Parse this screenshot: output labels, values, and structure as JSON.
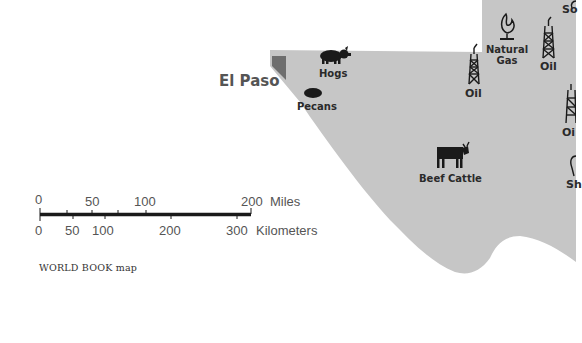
{
  "map": {
    "colors": {
      "land": "#c6c6c6",
      "water_border": "#6e6e6e",
      "icon": "#1a1a1a",
      "label": "#2a2a2a",
      "city": "#555555"
    },
    "city": {
      "name": "El Paso"
    },
    "products": [
      {
        "id": "hogs",
        "label": "Hogs",
        "icon": "pig-icon"
      },
      {
        "id": "pecans",
        "label": "Pecans",
        "icon": "pecan-icon"
      },
      {
        "id": "oil-1",
        "label": "Oil",
        "icon": "oil-derrick-icon"
      },
      {
        "id": "natural-gas",
        "label_line1": "Natural",
        "label_line2": "Gas",
        "icon": "gas-flame-icon"
      },
      {
        "id": "oil-2",
        "label": "Oil",
        "icon": "oil-derrick-icon"
      },
      {
        "id": "oil-3",
        "label": "Oi",
        "icon": "oil-derrick-icon"
      },
      {
        "id": "beef-cattle",
        "label": "Beef Cattle",
        "icon": "cow-icon"
      },
      {
        "id": "sheep",
        "label": "Sh",
        "icon": "sheep-icon"
      },
      {
        "id": "sorghum",
        "label": "So",
        "icon": "sorghum-icon"
      }
    ],
    "scale": {
      "miles": {
        "ticks": [
          "0",
          "50",
          "100",
          "200"
        ],
        "unit": "Miles"
      },
      "kilometers": {
        "ticks": [
          "0",
          "50",
          "100",
          "200",
          "300"
        ],
        "unit": "Kilometers"
      }
    },
    "credit": "WORLD BOOK map"
  }
}
